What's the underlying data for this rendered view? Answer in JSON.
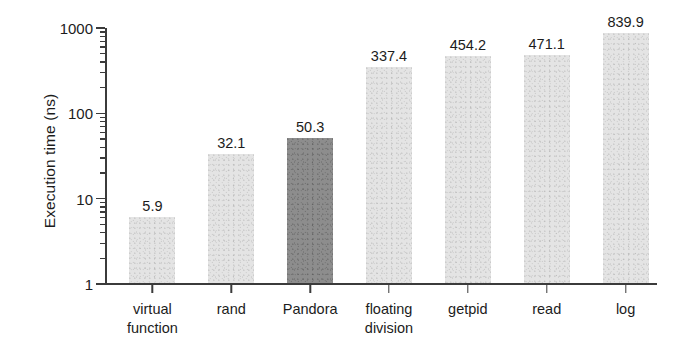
{
  "chart_data": {
    "type": "bar",
    "title": "",
    "subtitle": "",
    "xlabel": "",
    "ylabel": "Execution time (ns)",
    "yscale": "log",
    "ylim": [
      1,
      1000
    ],
    "grid": false,
    "legend": null,
    "categories": [
      "virtual function",
      "rand",
      "Pandora",
      "floating division",
      "getpid",
      "read",
      "log"
    ],
    "category_lines": [
      [
        "virtual",
        "function"
      ],
      [
        "rand"
      ],
      [
        "Pandora"
      ],
      [
        "floating",
        "division"
      ],
      [
        "getpid"
      ],
      [
        "read"
      ],
      [
        "log"
      ]
    ],
    "values": [
      5.9,
      32.1,
      50.3,
      337.4,
      454.2,
      471.1,
      839.9
    ],
    "value_labels": [
      "5.9",
      "32.1",
      "50.3",
      "337.4",
      "454.2",
      "471.1",
      "839.9"
    ],
    "ytick_labels": [
      "1000",
      "100",
      "10",
      "1"
    ],
    "ytick_values": [
      1000,
      100,
      10,
      1
    ],
    "highlight_category": "Pandora",
    "colors": {
      "bar": "#e4e4e4",
      "bar_highlight": "#8d8d8d",
      "axis": "#3b3b3b",
      "text": "#1c1c1c",
      "background": "#ffffff"
    }
  }
}
